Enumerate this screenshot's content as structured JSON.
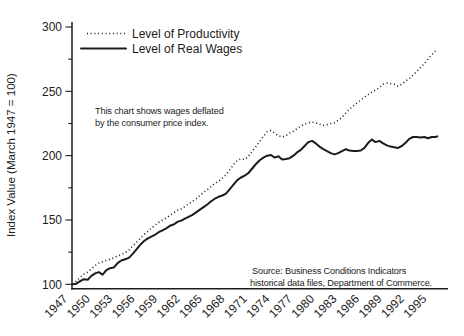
{
  "colors": {
    "ink": "#1c1c1c",
    "background": "#ffffff"
  },
  "y_axis": {
    "label": "Index Value (March 1947 = 100)",
    "ticks": [
      100,
      150,
      200,
      250,
      300
    ],
    "minor_ticks": [
      125,
      175,
      225,
      275
    ]
  },
  "x_axis": {
    "ticks": [
      1947,
      1950,
      1953,
      1956,
      1959,
      1962,
      1965,
      1968,
      1971,
      1974,
      1977,
      1980,
      1983,
      1986,
      1989,
      1992,
      1995
    ]
  },
  "legend": [
    {
      "label": "Level of Productivity",
      "style": "dotted"
    },
    {
      "label": "Level of Real Wages",
      "style": "solid"
    }
  ],
  "annotation": {
    "line1": "This chart shows wages deflated",
    "line2": "by the consumer price index."
  },
  "source": {
    "line1": "Source: Business Conditions Indicators",
    "line2": "historical data files, Department of Commerce."
  },
  "chart_data": {
    "type": "line",
    "title": "",
    "xlabel": "",
    "ylabel": "Index Value (March 1947 = 100)",
    "xlim": [
      1947,
      1997
    ],
    "ylim": [
      100,
      300
    ],
    "grid": false,
    "legend_position": "top-left-inside",
    "columns": [
      "year",
      "productivity",
      "real_wages"
    ],
    "series": [
      {
        "name": "Level of Productivity",
        "style": "dotted"
      },
      {
        "name": "Level of Real Wages",
        "style": "solid"
      }
    ],
    "rows": [
      [
        1947,
        100,
        100
      ],
      [
        1947.5,
        102.5,
        100.5
      ],
      [
        1948,
        105.5,
        102.5
      ],
      [
        1948.5,
        108,
        104
      ],
      [
        1949,
        109.5,
        103.5
      ],
      [
        1949.5,
        112,
        106.5
      ],
      [
        1950,
        114.5,
        108.5
      ],
      [
        1950.5,
        116.5,
        109.5
      ],
      [
        1951,
        117.5,
        107.5
      ],
      [
        1951.5,
        118.5,
        111
      ],
      [
        1952,
        119.5,
        112.5
      ],
      [
        1952.5,
        120.5,
        113
      ],
      [
        1953,
        122,
        116.5
      ],
      [
        1953.5,
        123,
        118.5
      ],
      [
        1954,
        124.5,
        119.5
      ],
      [
        1954.5,
        126.5,
        120.5
      ],
      [
        1955,
        129.5,
        123.5
      ],
      [
        1955.5,
        132.5,
        127
      ],
      [
        1956,
        135.5,
        130.5
      ],
      [
        1956.5,
        138.5,
        133.5
      ],
      [
        1957,
        141,
        135.5
      ],
      [
        1957.5,
        143.5,
        137
      ],
      [
        1958,
        146,
        138.5
      ],
      [
        1958.5,
        148,
        140.5
      ],
      [
        1959,
        150,
        142
      ],
      [
        1959.5,
        151.5,
        143.5
      ],
      [
        1960,
        153.5,
        145.5
      ],
      [
        1960.5,
        155.5,
        146.5
      ],
      [
        1961,
        157.5,
        148.5
      ],
      [
        1961.5,
        158.5,
        149.5
      ],
      [
        1962,
        160.5,
        151
      ],
      [
        1962.5,
        162.5,
        152.5
      ],
      [
        1963,
        164.5,
        154
      ],
      [
        1963.5,
        166.5,
        156
      ],
      [
        1964,
        169,
        158
      ],
      [
        1964.5,
        171.5,
        160
      ],
      [
        1965,
        173.5,
        162
      ],
      [
        1965.5,
        176,
        164.5
      ],
      [
        1966,
        178.5,
        166.5
      ],
      [
        1966.5,
        180,
        168
      ],
      [
        1967,
        182.5,
        169
      ],
      [
        1967.5,
        185,
        170.5
      ],
      [
        1968,
        189,
        174
      ],
      [
        1968.5,
        193,
        177.5
      ],
      [
        1969,
        196.5,
        181
      ],
      [
        1969.5,
        197.5,
        183
      ],
      [
        1970,
        197,
        184.5
      ],
      [
        1970.5,
        199.5,
        186.5
      ],
      [
        1971,
        203.5,
        190
      ],
      [
        1971.5,
        207,
        193.5
      ],
      [
        1972,
        211,
        196.5
      ],
      [
        1972.5,
        215,
        198.5
      ],
      [
        1973,
        218.5,
        200
      ],
      [
        1973.5,
        219.5,
        200.5
      ],
      [
        1974,
        217.5,
        198.5
      ],
      [
        1974.5,
        215.5,
        199.5
      ],
      [
        1975,
        214.5,
        197
      ],
      [
        1975.5,
        215.5,
        197.5
      ],
      [
        1976,
        217.5,
        198
      ],
      [
        1976.5,
        219,
        200
      ],
      [
        1977,
        221,
        202.5
      ],
      [
        1977.5,
        223,
        204.5
      ],
      [
        1978,
        224.5,
        207.5
      ],
      [
        1978.5,
        225.5,
        210.5
      ],
      [
        1979,
        226,
        211.5
      ],
      [
        1979.5,
        225.5,
        209.5
      ],
      [
        1980,
        224.5,
        207
      ],
      [
        1980.5,
        223.5,
        205
      ],
      [
        1981,
        224,
        203.5
      ],
      [
        1981.5,
        225,
        202
      ],
      [
        1982,
        225.5,
        201
      ],
      [
        1982.5,
        227.5,
        202
      ],
      [
        1983,
        230,
        203.5
      ],
      [
        1983.5,
        233,
        205
      ],
      [
        1984,
        236,
        204
      ],
      [
        1984.5,
        238.5,
        203.5
      ],
      [
        1985,
        241,
        203.5
      ],
      [
        1985.5,
        243,
        204
      ],
      [
        1986,
        245.5,
        206
      ],
      [
        1986.5,
        247.5,
        210
      ],
      [
        1987,
        249.5,
        212.5
      ],
      [
        1987.5,
        251,
        210.5
      ],
      [
        1988,
        253,
        211.5
      ],
      [
        1988.5,
        255.5,
        209.5
      ],
      [
        1989,
        256.5,
        208
      ],
      [
        1989.5,
        256,
        207
      ],
      [
        1990,
        255.5,
        206.5
      ],
      [
        1990.5,
        254,
        206
      ],
      [
        1991,
        255.5,
        207.5
      ],
      [
        1991.5,
        258,
        210
      ],
      [
        1992,
        260,
        213
      ],
      [
        1992.5,
        262.5,
        214.5
      ],
      [
        1993,
        265.5,
        214.5
      ],
      [
        1993.5,
        268.5,
        214
      ],
      [
        1994,
        271.5,
        214.5
      ],
      [
        1994.5,
        275,
        213.5
      ],
      [
        1995,
        278.5,
        214.5
      ],
      [
        1995.5,
        281.5,
        214.5
      ],
      [
        1995.75,
        283,
        215
      ]
    ]
  }
}
